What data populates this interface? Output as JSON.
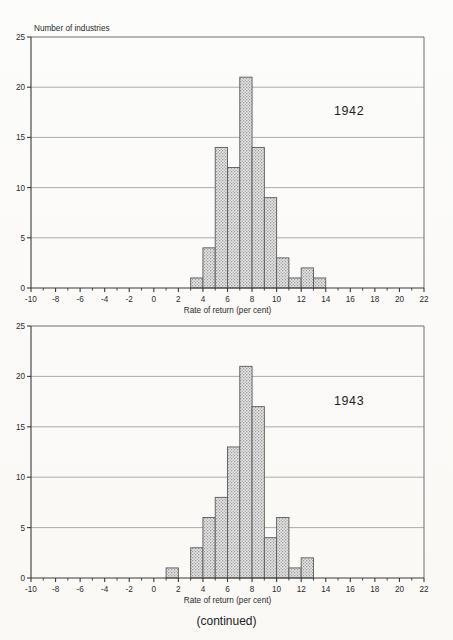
{
  "figure": {
    "caption": "(continued)",
    "bar_fill": "#d9d9d9",
    "bar_stroke": "#5a5a5a"
  },
  "panels": [
    {
      "id": "panel-1942",
      "year_label": "1942",
      "ylabel_top": "Number of industries",
      "xlabel": "Rate of return (per cent)",
      "chart_data": {
        "type": "bar",
        "title": "1942",
        "xlabel": "Rate of return (per cent)",
        "ylabel": "Number of industries",
        "xlim": [
          -10,
          22
        ],
        "ylim": [
          0,
          25
        ],
        "grid": true,
        "legend": "none",
        "bin_width": 1,
        "x_ticks": [
          -10,
          -8,
          -6,
          -4,
          -2,
          0,
          2,
          4,
          6,
          8,
          10,
          12,
          14,
          16,
          18,
          20,
          22
        ],
        "x_tick_labels": [
          "-10",
          "-8",
          "-6",
          "-4",
          "-2",
          "0",
          "2",
          "4",
          "6",
          "8",
          "10",
          "12",
          "14",
          "16",
          "18",
          "20",
          "22"
        ],
        "y_ticks": [
          0,
          5,
          10,
          15,
          20,
          25
        ],
        "y_tick_labels": [
          "0",
          "5",
          "10",
          "15",
          "20",
          "25"
        ],
        "bins": [
          {
            "start": 3,
            "end": 4,
            "value": 1
          },
          {
            "start": 4,
            "end": 5,
            "value": 4
          },
          {
            "start": 5,
            "end": 6,
            "value": 14
          },
          {
            "start": 6,
            "end": 7,
            "value": 12
          },
          {
            "start": 7,
            "end": 8,
            "value": 21
          },
          {
            "start": 8,
            "end": 9,
            "value": 14
          },
          {
            "start": 9,
            "end": 10,
            "value": 9
          },
          {
            "start": 10,
            "end": 11,
            "value": 3
          },
          {
            "start": 11,
            "end": 12,
            "value": 1
          },
          {
            "start": 12,
            "end": 13,
            "value": 2
          },
          {
            "start": 13,
            "end": 14,
            "value": 1
          }
        ]
      }
    },
    {
      "id": "panel-1943",
      "year_label": "1943",
      "ylabel_top": "",
      "xlabel": "Rate of return (per cent)",
      "chart_data": {
        "type": "bar",
        "title": "1943",
        "xlabel": "Rate of return (per cent)",
        "ylabel": "Number of industries",
        "xlim": [
          -10,
          22
        ],
        "ylim": [
          0,
          25
        ],
        "grid": true,
        "legend": "none",
        "bin_width": 1,
        "x_ticks": [
          -10,
          -8,
          -6,
          -4,
          -2,
          0,
          2,
          4,
          6,
          8,
          10,
          12,
          14,
          16,
          18,
          20,
          22
        ],
        "x_tick_labels": [
          "-10",
          "-8",
          "-6",
          "-4",
          "-2",
          "0",
          "2",
          "4",
          "6",
          "8",
          "10",
          "12",
          "14",
          "16",
          "18",
          "20",
          "22"
        ],
        "y_ticks": [
          0,
          5,
          10,
          15,
          20,
          25
        ],
        "y_tick_labels": [
          "0",
          "5",
          "10",
          "15",
          "20",
          "25"
        ],
        "bins": [
          {
            "start": 1,
            "end": 2,
            "value": 1
          },
          {
            "start": 3,
            "end": 4,
            "value": 3
          },
          {
            "start": 4,
            "end": 5,
            "value": 6
          },
          {
            "start": 5,
            "end": 6,
            "value": 8
          },
          {
            "start": 6,
            "end": 7,
            "value": 13
          },
          {
            "start": 7,
            "end": 8,
            "value": 21
          },
          {
            "start": 8,
            "end": 9,
            "value": 17
          },
          {
            "start": 9,
            "end": 10,
            "value": 4
          },
          {
            "start": 10,
            "end": 11,
            "value": 6
          },
          {
            "start": 11,
            "end": 12,
            "value": 1
          },
          {
            "start": 12,
            "end": 13,
            "value": 2
          }
        ]
      }
    }
  ]
}
